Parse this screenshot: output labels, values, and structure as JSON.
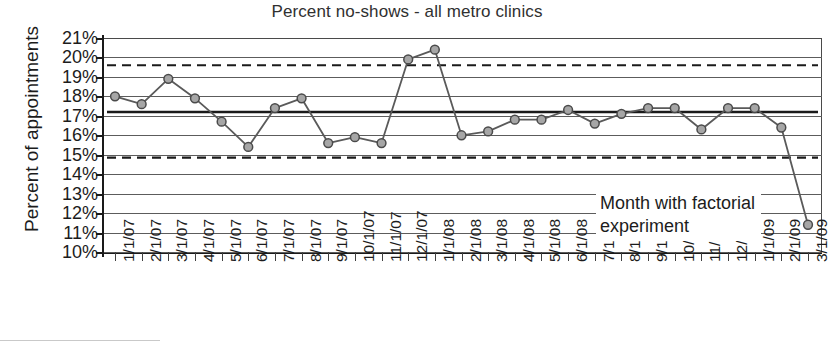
{
  "chart_data": {
    "type": "line",
    "title": "Percent no-shows - all metro clinics",
    "xlabel": "",
    "ylabel": "Percent of appointments",
    "ylim": [
      10,
      21
    ],
    "ytick_labels": [
      "21%",
      "20%",
      "19%",
      "18%",
      "17%",
      "16%",
      "15%",
      "14%",
      "13%",
      "12%",
      "11%",
      "10%"
    ],
    "ytick_values": [
      21,
      20,
      19,
      18,
      17,
      16,
      15,
      14,
      13,
      12,
      11,
      10
    ],
    "grid": true,
    "legend": "none",
    "categories": [
      "1/1/07",
      "2/1/07",
      "3/1/07",
      "4/1/07",
      "5/1/07",
      "6/1/07",
      "7/1/07",
      "8/1/07",
      "9/1/07",
      "10/1/07",
      "11/1/07",
      "12/1/07",
      "1/1/08",
      "2/1/08",
      "3/1/08",
      "4/1/08",
      "5/1/08",
      "6/1/08",
      "7/1/08",
      "8/1/08",
      "9/1/08",
      "10/1/08",
      "11/1/08",
      "12/1/08",
      "1/1/09",
      "2/1/09",
      "3/1/09"
    ],
    "series": [
      {
        "name": "Percent no-shows",
        "values": [
          18.0,
          17.6,
          18.9,
          17.9,
          16.7,
          15.4,
          17.4,
          17.9,
          15.6,
          15.9,
          15.6,
          19.9,
          20.4,
          16.0,
          16.2,
          16.8,
          16.8,
          17.3,
          16.6,
          17.1,
          17.4,
          17.4,
          16.3,
          17.4,
          17.4,
          16.4,
          11.4
        ]
      }
    ],
    "reference_lines": [
      {
        "name": "upper-control-limit",
        "value": 19.6,
        "style": "dashed"
      },
      {
        "name": "center-line",
        "value": 17.2,
        "style": "solid-thick"
      },
      {
        "name": "lower-control-limit",
        "value": 14.85,
        "style": "dashed"
      }
    ],
    "annotations": [
      {
        "name": "factorial-experiment-note",
        "line1": "Month with factorial",
        "line2": "experiment"
      }
    ],
    "colors": {
      "line": "#5a5a5a",
      "marker_fill": "#a6a6a6",
      "marker_stroke": "#4a4a4a",
      "grid": "#5c5c5c",
      "axis": "#1a1a1a",
      "reference": "#1a1a1a"
    }
  }
}
